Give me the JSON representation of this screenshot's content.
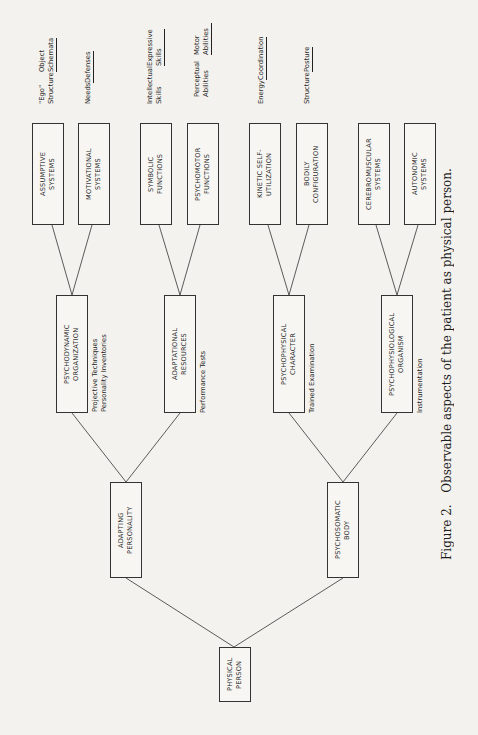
{
  "caption": {
    "label": "Figure 2.",
    "text": "Observable aspects of the patient as physical person."
  },
  "root": {
    "label": "PHYSICAL\nPERSON"
  },
  "level1": [
    {
      "label": "ADAPTING\nPERSONALITY"
    },
    {
      "label": "PSYCHOSOMATIC\nBODY"
    }
  ],
  "level2": [
    {
      "label": "PSYCHODYNAMIC\nORGANIZATION",
      "method": "Projective Techniques\nPersonality Inventories"
    },
    {
      "label": "ADAPTATIONAL\nRESOURCES",
      "method": "Performance Tests"
    },
    {
      "label": "PSYCHOPHYSICAL\nCHARACTER",
      "method": "Trained Examination"
    },
    {
      "label": "PSYCHOPHYSIOLOGICAL\nORGANISM",
      "method": "Instrumentation"
    }
  ],
  "level3": [
    {
      "label": "ASSUMPTIVE\nSYSTEMS",
      "top": "\"Ego\" Structure",
      "bottom": "Object Schemata"
    },
    {
      "label": "MOTIVATIONAL\nSYSTEMS",
      "top": "Needs",
      "bottom": "Defenses"
    },
    {
      "label": "SYMBOLIC\nFUNCTIONS",
      "top": "Intellectual Skills",
      "bottom": "Expressive Skills"
    },
    {
      "label": "PSYCHOMOTOR\nFUNCTIONS",
      "top": "Perceptual Abilities",
      "bottom": "Motor Abilities"
    },
    {
      "label": "KINETIC SELF-\nUTILIZATION",
      "top": "Energy",
      "bottom": "Coordination"
    },
    {
      "label": "BODILY\nCONFIGURATION",
      "top": "Structure",
      "bottom": "Posture"
    },
    {
      "label": "CEREBROMUSCULAR\nSYSTEMS",
      "top": "",
      "bottom": ""
    },
    {
      "label": "AUTONOMIC\nSYSTEMS",
      "top": "",
      "bottom": ""
    }
  ]
}
